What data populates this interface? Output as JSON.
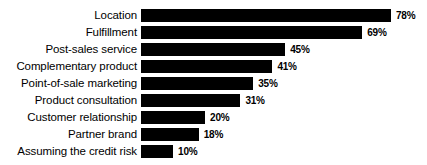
{
  "chart_data": {
    "type": "bar",
    "orientation": "horizontal",
    "title": "",
    "subtitle": "",
    "xlabel": "",
    "ylabel": "",
    "grid": false,
    "legend": null,
    "value_suffix": "%",
    "xlim": [
      0,
      78
    ],
    "axis_visible": false,
    "bar_color": "#000000",
    "label_color": "#000000",
    "background": "#ffffff",
    "categories": [
      "Location",
      "Fulfillment",
      "Post-sales service",
      "Complementary product",
      "Point-of-sale marketing",
      "Product consultation",
      "Customer relationship",
      "Partner brand",
      "Assuming the credit risk"
    ],
    "values": [
      78,
      69,
      45,
      41,
      35,
      31,
      20,
      18,
      10
    ],
    "data_labels": [
      "78%",
      "69%",
      "45%",
      "41%",
      "35%",
      "31%",
      "20%",
      "18%",
      "10%"
    ],
    "bars": [
      {
        "category": "Location",
        "value": 78,
        "label": "78%"
      },
      {
        "category": "Fulfillment",
        "value": 69,
        "label": "69%"
      },
      {
        "category": "Post-sales service",
        "value": 45,
        "label": "45%"
      },
      {
        "category": "Complementary product",
        "value": 41,
        "label": "41%"
      },
      {
        "category": "Point-of-sale marketing",
        "value": 35,
        "label": "35%"
      },
      {
        "category": "Product consultation",
        "value": 31,
        "label": "31%"
      },
      {
        "category": "Customer relationship",
        "value": 20,
        "label": "20%"
      },
      {
        "category": "Partner brand",
        "value": 18,
        "label": "18%"
      },
      {
        "category": "Assuming the credit risk",
        "value": 10,
        "label": "10%"
      }
    ]
  }
}
